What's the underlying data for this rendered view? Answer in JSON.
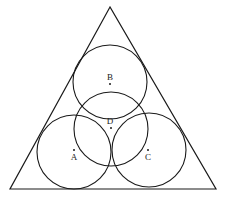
{
  "diagram": {
    "type": "geometry",
    "stroke_color": "#1a1a1a",
    "background": "#ffffff",
    "triangle": {
      "vertices": [
        [
          110,
          7
        ],
        [
          10,
          189
        ],
        [
          216,
          189
        ]
      ]
    },
    "circles": [
      {
        "name": "A",
        "cx": 74,
        "cy": 152,
        "r": 37
      },
      {
        "name": "B",
        "cx": 110,
        "cy": 82,
        "r": 37
      },
      {
        "name": "C",
        "cx": 149,
        "cy": 150,
        "r": 37
      },
      {
        "name": "D",
        "cx": 111,
        "cy": 129,
        "r": 37
      }
    ],
    "points": [
      {
        "label": "A",
        "x": 74,
        "y": 150,
        "label_x": 74,
        "label_y": 160
      },
      {
        "label": "B",
        "x": 110,
        "y": 84,
        "label_x": 110,
        "label_y": 80
      },
      {
        "label": "C",
        "x": 148,
        "y": 150,
        "label_x": 148,
        "label_y": 160
      },
      {
        "label": "D",
        "x": 111,
        "y": 128,
        "label_x": 110,
        "label_y": 124
      }
    ]
  }
}
